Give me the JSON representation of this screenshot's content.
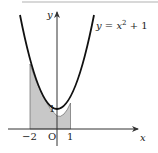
{
  "diagram": {
    "type": "function-graph",
    "curve_label": "y = x² + 1",
    "curve_label_parts": {
      "lhs": "y",
      "eq": " = ",
      "var": "x",
      "exp": "2",
      "rest": " + 1"
    },
    "axes": {
      "x_label": "x",
      "y_label": "y",
      "origin_label": "O"
    },
    "x_ticks": [
      {
        "value": -2,
        "label": "−2"
      },
      {
        "value": 1,
        "label": "1"
      }
    ],
    "y_ticks": [
      {
        "value": 1,
        "label": "1"
      }
    ],
    "shaded_region": {
      "from": -2,
      "to": 1,
      "description": "area under y = x² + 1 from x = −2 to x = 1",
      "color": "#c8c8c8"
    },
    "colors": {
      "curve": "#111111",
      "axis": "#333333",
      "shade": "#c8c8c8",
      "background": "#ffffff"
    }
  }
}
